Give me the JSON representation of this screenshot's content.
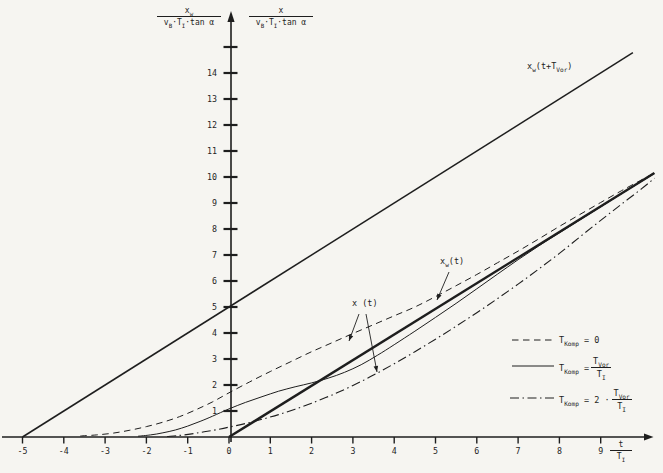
{
  "canvas": {
    "bg": "#f6f5f1",
    "ink": "#1e1e1e"
  },
  "labels": {
    "y_left": {
      "num_base": "x",
      "num_sub": "w",
      "den1": "v",
      "den1_sub": "B",
      "den2": "·T",
      "den2_sub": "I",
      "den3": "·tan α"
    },
    "y_right": {
      "num_base": "x",
      "den1": "v",
      "den1_sub": "B",
      "den2": "·T",
      "den2_sub": "I",
      "den3": "·tan α"
    },
    "x_axis": {
      "num": "t",
      "den_base": "T",
      "den_sub": "I"
    },
    "xw_lead": {
      "p1": "x",
      "s1": "w",
      "p2": "(t+T",
      "s2": "Vor",
      "p3": ")"
    },
    "xw_t": {
      "p1": "x",
      "s1": "w",
      "p2": "(t)"
    },
    "x_t": {
      "text": "x (t)"
    }
  },
  "legend": {
    "entries": [
      {
        "name": "tkomp-0",
        "p1": "T",
        "s1": "Komp",
        "p2": " = 0"
      },
      {
        "name": "tkomp-tvor",
        "p1": "T",
        "s1": "Komp",
        "p2": " = ",
        "frac": {
          "n1": "T",
          "ns": "Vor",
          "d1": "T",
          "ds": "I"
        }
      },
      {
        "name": "tkomp-2tvor",
        "p1": "T",
        "s1": "Komp",
        "p2": " = 2 ·",
        "frac": {
          "n1": "T",
          "ns": "Vor",
          "d1": "T",
          "ds": "I"
        }
      }
    ]
  },
  "chart_data": {
    "type": "line",
    "title": "",
    "xlabel": "t / T_I",
    "ylabel_left": "x_w / (v_B · T_I · tan α)",
    "ylabel_right": "x / (v_B · T_I · tan α)",
    "grid": false,
    "legend_position": "lower right",
    "map": {
      "origin": [
        229,
        437
      ],
      "ux": 41.3,
      "uy": 26.0
    },
    "axes": {
      "x": {
        "ticks": [
          -5,
          -4,
          -3,
          -2,
          -1,
          0,
          1,
          2,
          3,
          4,
          5,
          6,
          7,
          8,
          9
        ],
        "range": [
          -5.5,
          10.5
        ]
      },
      "y": {
        "ticks": [
          1,
          2,
          3,
          4,
          5,
          6,
          7,
          8,
          9,
          10,
          11,
          12,
          13,
          14
        ],
        "extra_unlabeled_tick": 15,
        "range": [
          0,
          15.5
        ]
      }
    },
    "dash_patterns": {
      "solid": "",
      "dashed": "6.5 4.5",
      "dashdot": "9 3.5 1.5 3.5"
    },
    "series": [
      {
        "id": "xw-lead-line",
        "label": "x_w(t+T_Vor)",
        "style": "solid",
        "width": 1.5,
        "smooth": false,
        "points": [
          [
            -5,
            0
          ],
          [
            9.78,
            14.78
          ]
        ]
      },
      {
        "id": "xw-ramp",
        "label": "x_w(t)",
        "style": "solid",
        "width": 2.4,
        "smooth": false,
        "points": [
          [
            0,
            0
          ],
          [
            10.3,
            10.15
          ]
        ]
      },
      {
        "id": "tkomp-0",
        "label": "T_Komp = 0",
        "style": "dashed",
        "width": 1,
        "smooth": true,
        "points": [
          [
            -3.6,
            0.04
          ],
          [
            -3.2,
            0.08
          ],
          [
            -2.8,
            0.15
          ],
          [
            -2.4,
            0.26
          ],
          [
            -2,
            0.4
          ],
          [
            -1.6,
            0.57
          ],
          [
            -1.2,
            0.78
          ],
          [
            -0.8,
            1.05
          ],
          [
            -0.4,
            1.35
          ],
          [
            0,
            1.7
          ],
          [
            0.5,
            2.12
          ],
          [
            1,
            2.52
          ],
          [
            1.5,
            2.9
          ],
          [
            2,
            3.28
          ],
          [
            2.5,
            3.63
          ],
          [
            3,
            3.98
          ],
          [
            3.5,
            4.32
          ],
          [
            4,
            4.66
          ],
          [
            4.5,
            5.0
          ],
          [
            5,
            5.4
          ],
          [
            5.5,
            5.82
          ],
          [
            6,
            6.25
          ],
          [
            6.5,
            6.7
          ],
          [
            7,
            7.15
          ],
          [
            7.5,
            7.62
          ],
          [
            8,
            8.1
          ],
          [
            8.5,
            8.56
          ],
          [
            9,
            9.02
          ],
          [
            9.5,
            9.47
          ],
          [
            10,
            9.9
          ],
          [
            10.3,
            10.16
          ]
        ]
      },
      {
        "id": "tkomp-1",
        "label": "T_Komp = T_Vor/T_I",
        "style": "solid",
        "width": 1,
        "smooth": true,
        "points": [
          [
            -2.2,
            0.03
          ],
          [
            -1.9,
            0.08
          ],
          [
            -1.6,
            0.16
          ],
          [
            -1.3,
            0.27
          ],
          [
            -1,
            0.42
          ],
          [
            -0.7,
            0.6
          ],
          [
            -0.4,
            0.8
          ],
          [
            0,
            1.08
          ],
          [
            0.4,
            1.33
          ],
          [
            0.8,
            1.55
          ],
          [
            1.2,
            1.76
          ],
          [
            1.6,
            1.93
          ],
          [
            2,
            2.08
          ],
          [
            2.4,
            2.26
          ],
          [
            2.8,
            2.49
          ],
          [
            3.2,
            2.78
          ],
          [
            3.6,
            3.15
          ],
          [
            4,
            3.55
          ],
          [
            4.5,
            4.07
          ],
          [
            5,
            4.6
          ],
          [
            5.5,
            5.14
          ],
          [
            6,
            5.7
          ],
          [
            6.5,
            6.26
          ],
          [
            7,
            6.82
          ],
          [
            7.5,
            7.35
          ],
          [
            8,
            7.85
          ],
          [
            8.5,
            8.35
          ],
          [
            9,
            8.85
          ],
          [
            9.5,
            9.35
          ],
          [
            10,
            9.84
          ],
          [
            10.3,
            10.13
          ]
        ]
      },
      {
        "id": "tkomp-2",
        "label": "T_Komp = 2·T_Vor/T_I",
        "style": "dashdot",
        "width": 1.1,
        "smooth": true,
        "points": [
          [
            -1.5,
            0.02
          ],
          [
            -1.2,
            0.06
          ],
          [
            -0.9,
            0.12
          ],
          [
            -0.6,
            0.2
          ],
          [
            -0.3,
            0.28
          ],
          [
            0,
            0.38
          ],
          [
            0.4,
            0.52
          ],
          [
            0.8,
            0.68
          ],
          [
            1.2,
            0.86
          ],
          [
            1.6,
            1.07
          ],
          [
            2,
            1.3
          ],
          [
            2.5,
            1.62
          ],
          [
            3,
            1.98
          ],
          [
            3.5,
            2.38
          ],
          [
            4,
            2.82
          ],
          [
            4.5,
            3.28
          ],
          [
            5,
            3.76
          ],
          [
            5.5,
            4.26
          ],
          [
            6,
            4.78
          ],
          [
            6.5,
            5.32
          ],
          [
            7,
            5.88
          ],
          [
            7.5,
            6.46
          ],
          [
            8,
            7.06
          ],
          [
            8.5,
            7.7
          ],
          [
            9,
            8.33
          ],
          [
            9.5,
            8.95
          ],
          [
            10,
            9.56
          ],
          [
            10.3,
            9.95
          ]
        ]
      }
    ],
    "annotation_arrows": [
      {
        "name": "arrow-xw-t",
        "from": [
          449,
          272
        ],
        "to": [
          437,
          300
        ]
      },
      {
        "name": "arrow-x-t-dashed",
        "from": [
          359,
          314
        ],
        "to": [
          349,
          341
        ]
      },
      {
        "name": "arrow-x-t-dashdot",
        "from": [
          366,
          314
        ],
        "to": [
          377,
          372
        ]
      }
    ],
    "legend_samples": [
      {
        "style": "dashed",
        "x1": 512,
        "y": 340,
        "x2": 554
      },
      {
        "style": "solid",
        "x1": 512,
        "y": 366,
        "x2": 554
      },
      {
        "style": "dashdot",
        "x1": 510,
        "y": 398,
        "x2": 554
      }
    ]
  }
}
